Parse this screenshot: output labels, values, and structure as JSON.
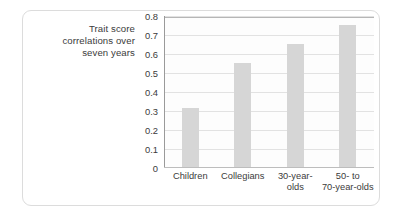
{
  "chart_data": {
    "type": "bar",
    "title": "",
    "xlabel": "",
    "ylabel": "Trait score correlations over seven years",
    "ylabel_lines": [
      "Trait score",
      "correlations over",
      "seven years"
    ],
    "categories": [
      "Children",
      "Collegians",
      "30-year-olds",
      "50- to 70-year-olds"
    ],
    "category_lines": [
      [
        "Children"
      ],
      [
        "Collegians"
      ],
      [
        "30-year-",
        "olds"
      ],
      [
        "50- to",
        "70-year-olds"
      ]
    ],
    "values": [
      0.31,
      0.545,
      0.645,
      0.75
    ],
    "ylim": [
      0,
      0.8
    ],
    "ytick_labels": [
      "0.8",
      "0.7",
      "0.6",
      "0.5",
      "0.4",
      "0.3",
      "0.2",
      "0.1",
      "0"
    ],
    "ytick_values": [
      0.8,
      0.7,
      0.6,
      0.5,
      0.4,
      0.3,
      0.2,
      0.1,
      0
    ],
    "grid": true,
    "legend": "none",
    "bar_color": "#d6d6d6",
    "gridline_color": "#e2e2e2",
    "axis_color": "#9a9a9a",
    "text_color": "#3b3b3b",
    "plot_background": "#fdfdfd",
    "card_border_color": "#dcdcdc"
  }
}
